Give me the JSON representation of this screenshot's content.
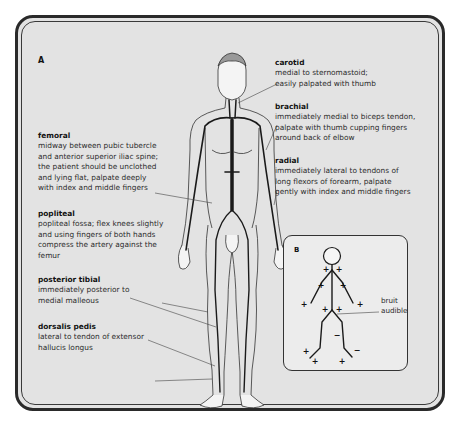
{
  "panel_a": {
    "letter": "A",
    "pulses": {
      "carotid": {
        "title": "carotid",
        "desc": "medial to sternomastoid;\neasily palpated with thumb"
      },
      "brachial": {
        "title": "brachial",
        "desc": "immediately medial to biceps tendon,\npalpate with thumb cupping fingers\naround back of elbow"
      },
      "radial": {
        "title": "radial",
        "desc": "immediately lateral to tendons of\nlong flexors of forearm, palpate\ngently with index and middle fingers"
      },
      "femoral": {
        "title": "femoral",
        "desc": "midway between pubic tubercle\nand anterior superior iliac spine;\nthe patient should be unclothed\nand lying flat, palpate deeply\nwith index and middle fingers"
      },
      "popliteal": {
        "title": "popliteal",
        "desc": "popliteal fossa; flex knees slightly\nand using fingers of both hands\ncompress the artery against the\nfemur"
      },
      "posterior_tibial": {
        "title": "posterior tibial",
        "desc": "immediately posterior to\nmedial malleous"
      },
      "dorsalis_pedis": {
        "title": "dorsalis pedis",
        "desc": "lateral to tendon of extensor\nhallucis longus"
      }
    }
  },
  "panel_b": {
    "letter": "B",
    "annotation": "bruit\naudible",
    "markers": [
      {
        "site": "right carotid",
        "sign": "+"
      },
      {
        "site": "left carotid",
        "sign": "+"
      },
      {
        "site": "right brachial",
        "sign": "+"
      },
      {
        "site": "left brachial",
        "sign": "+"
      },
      {
        "site": "right radial",
        "sign": "+"
      },
      {
        "site": "left radial",
        "sign": "+"
      },
      {
        "site": "right femoral",
        "sign": "+"
      },
      {
        "site": "left femoral",
        "sign": "+"
      },
      {
        "site": "left popliteal",
        "sign": "−"
      },
      {
        "site": "right posterior tibial",
        "sign": "+"
      },
      {
        "site": "right dorsalis pedis",
        "sign": "+"
      },
      {
        "site": "left posterior tibial",
        "sign": "+"
      },
      {
        "site": "left dorsalis pedis",
        "sign": "−"
      }
    ]
  },
  "colors": {
    "background": "#e3e3e3",
    "frame": "#2a2a2a",
    "artery": "#1a1a1a",
    "text": "#2b2b2b"
  }
}
